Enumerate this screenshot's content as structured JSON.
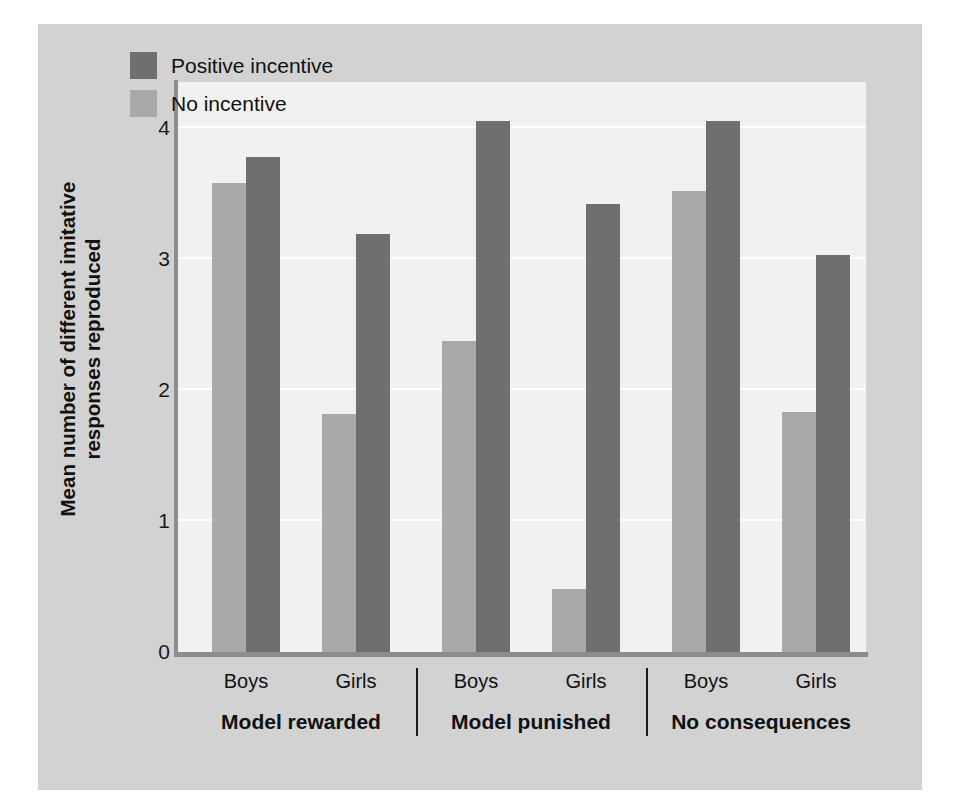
{
  "chart_data": {
    "type": "bar",
    "title": "",
    "xlabel": "",
    "ylabel": "Mean number of different imitative responses reproduced",
    "ylim": [
      0,
      4.35
    ],
    "yticks": [
      0,
      1,
      2,
      3,
      4
    ],
    "ytick_labels": [
      "0",
      "1",
      "2",
      "3",
      "4"
    ],
    "grid": true,
    "legend_position": "top-left",
    "categories": [
      "Boys",
      "Girls",
      "Boys",
      "Girls",
      "Boys",
      "Girls"
    ],
    "groups": [
      {
        "label": "Model rewarded",
        "subgroups": [
          {
            "label": "Boys",
            "no_incentive": 3.58,
            "positive_incentive": 3.78
          },
          {
            "label": "Girls",
            "no_incentive": 1.82,
            "positive_incentive": 3.19
          }
        ]
      },
      {
        "label": "Model punished",
        "subgroups": [
          {
            "label": "Boys",
            "no_incentive": 2.37,
            "positive_incentive": 4.05
          },
          {
            "label": "Girls",
            "no_incentive": 0.48,
            "positive_incentive": 3.42
          }
        ]
      },
      {
        "label": "No consequences",
        "subgroups": [
          {
            "label": "Boys",
            "no_incentive": 3.52,
            "positive_incentive": 4.05
          },
          {
            "label": "Girls",
            "no_incentive": 1.83,
            "positive_incentive": 3.03
          }
        ]
      }
    ],
    "series": [
      {
        "name": "No incentive",
        "color": "#a9a9a9",
        "values": [
          3.58,
          1.82,
          2.37,
          0.48,
          3.52,
          1.83
        ]
      },
      {
        "name": "Positive incentive",
        "color": "#6f6f6f",
        "values": [
          3.78,
          3.19,
          4.05,
          3.42,
          4.05,
          3.03
        ]
      }
    ]
  },
  "legend": {
    "items": [
      {
        "label": "Positive incentive",
        "color": "#6f6f6f",
        "swatch": "dark"
      },
      {
        "label": "No incentive",
        "color": "#a9a9a9",
        "swatch": "light"
      }
    ]
  },
  "colors": {
    "figure_background": "#d2d2d2",
    "plot_background": "#f1f1f1",
    "axis": "#8d8d8d",
    "gridline": "#ffffff",
    "dark_bar": "#6f6f6f",
    "light_bar": "#a9a9a9",
    "text": "#111111"
  }
}
